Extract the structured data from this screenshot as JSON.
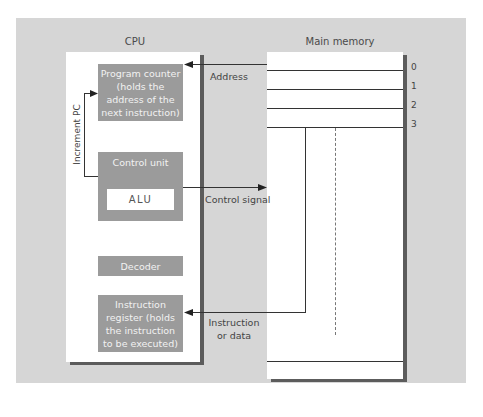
{
  "diagram": {
    "cpu": {
      "title": "CPU",
      "program_counter": [
        "Program counter",
        "(holds the",
        "address of the",
        "next instruction)"
      ],
      "increment_label": "Increment PC",
      "control_unit": "Control unit",
      "alu": "ALU",
      "decoder": "Decoder",
      "instruction_register": [
        "Instruction",
        "register (holds",
        "the instruction",
        "to be executed)"
      ]
    },
    "memory": {
      "title": "Main memory",
      "addresses": [
        "0",
        "1",
        "2",
        "3"
      ]
    },
    "signals": {
      "address": "Address",
      "control": "Control signal",
      "instruction": [
        "Instruction",
        "or data"
      ]
    },
    "colors": {
      "panel": "#d6d6d6",
      "box": "#9b9b9b",
      "shadow": "#5c5c5c",
      "line": "#333333"
    }
  }
}
